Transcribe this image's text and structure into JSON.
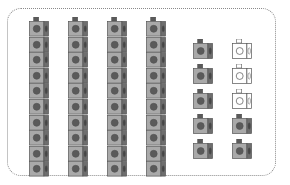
{
  "diagram": {
    "title": "",
    "tens_rods": [
      {
        "cubes": 10
      },
      {
        "cubes": 10
      },
      {
        "cubes": 10
      },
      {
        "cubes": 10
      }
    ],
    "units": [
      {
        "row": 1,
        "col": 1,
        "style": "filled"
      },
      {
        "row": 2,
        "col": 1,
        "style": "filled"
      },
      {
        "row": 3,
        "col": 1,
        "style": "filled"
      },
      {
        "row": 4,
        "col": 1,
        "style": "filled"
      },
      {
        "row": 5,
        "col": 1,
        "style": "filled"
      },
      {
        "row": 1,
        "col": 2,
        "style": "empty"
      },
      {
        "row": 2,
        "col": 2,
        "style": "empty"
      },
      {
        "row": 3,
        "col": 2,
        "style": "empty"
      },
      {
        "row": 4,
        "col": 2,
        "style": "filled"
      },
      {
        "row": 5,
        "col": 2,
        "style": "filled"
      }
    ],
    "counts": {
      "tens": 4,
      "filled_units": 7,
      "empty_units": 3,
      "total_filled": 47
    },
    "colors": {
      "cube_fill": "#a9a9a9",
      "cube_dark": "#6e6e6e",
      "stud": "#5a5a5a",
      "empty_fill": "#ffffff",
      "outline": "#555555",
      "frame": "#8a8a8a"
    }
  }
}
